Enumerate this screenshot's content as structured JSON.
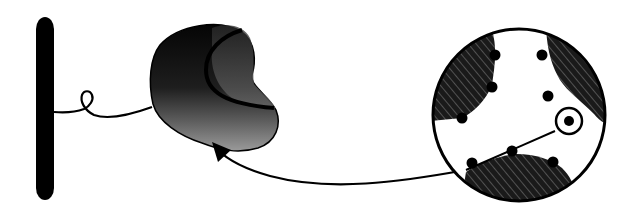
{
  "diagram": {
    "colors": {
      "ink": "#000000",
      "background": "#ffffff",
      "domain_dark": "#0a0a0a",
      "domain_mid": "#3a3a3a",
      "domain_light": "#8a8a8a"
    },
    "elements": [
      {
        "id": "membrane-bar",
        "shape": "rounded-rect",
        "x": 36,
        "y": 17,
        "w": 18,
        "h": 183
      },
      {
        "id": "tether-loop",
        "shape": "curve",
        "from": [
          54,
          112
        ],
        "to": [
          152,
          108
        ]
      },
      {
        "id": "kidney-domain",
        "shape": "blob",
        "center": [
          215,
          100
        ]
      },
      {
        "id": "magnified-circle",
        "shape": "circle",
        "cx": 519,
        "cy": 115,
        "r": 87
      },
      {
        "id": "highlight-site",
        "shape": "ring",
        "cx": 568,
        "cy": 121,
        "r": 12
      }
    ],
    "dot_count": 9,
    "hatched_region_count": 3
  }
}
